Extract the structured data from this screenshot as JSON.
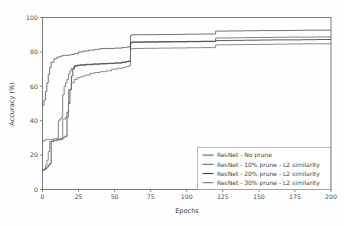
{
  "chart_data": {
    "type": "line",
    "title": "",
    "xlabel": "Epochs",
    "ylabel": "Accuracy (%)",
    "xlim": [
      0,
      200
    ],
    "ylim": [
      0,
      100
    ],
    "xticks": [
      0,
      25,
      50,
      75,
      100,
      125,
      150,
      175,
      200
    ],
    "yticks": [
      0,
      20,
      40,
      60,
      80,
      100
    ],
    "xtick_labels": [
      "0",
      "25",
      "50",
      "75",
      "100",
      "125",
      "150",
      "175",
      "200"
    ],
    "ytick_labels": [
      "0",
      "20",
      "40",
      "60",
      "80",
      "100"
    ],
    "grid": false,
    "legend_position": "lower right",
    "series": [
      {
        "name": "ResNet - No prune",
        "color": "#5a5a5a",
        "x": [
          0,
          1,
          2,
          3,
          4,
          5,
          6,
          8,
          10,
          12,
          14,
          16,
          18,
          20,
          22,
          25,
          28,
          32,
          36,
          40,
          45,
          50,
          55,
          58,
          60,
          61,
          62,
          70,
          80,
          90,
          100,
          110,
          119,
          120,
          121,
          130,
          140,
          150,
          160,
          170,
          180,
          190,
          200
        ],
        "y": [
          49.0,
          52.0,
          57.0,
          62.0,
          67.0,
          71.0,
          74.0,
          76.0,
          77.0,
          77.5,
          78.0,
          78.0,
          78.2,
          78.5,
          79.0,
          80.0,
          80.5,
          81.0,
          81.5,
          82.0,
          82.0,
          82.2,
          82.5,
          82.8,
          83.0,
          89.5,
          90.0,
          90.0,
          90.1,
          90.2,
          90.3,
          90.4,
          90.5,
          92.0,
          92.1,
          92.2,
          92.3,
          92.4,
          92.4,
          92.5,
          92.6,
          92.6,
          92.7
        ]
      },
      {
        "name": "ResNet - 10% prune - L2 similarity",
        "color": "#6a6a6a",
        "x": [
          0,
          1,
          2,
          3,
          5,
          8,
          10,
          11,
          12,
          13,
          14,
          15,
          16,
          17,
          18,
          19,
          20,
          22,
          24,
          26,
          30,
          35,
          40,
          45,
          50,
          55,
          58,
          60,
          61,
          62,
          70,
          80,
          90,
          100,
          110,
          119,
          120,
          121,
          130,
          140,
          150,
          160,
          170,
          180,
          190,
          200
        ],
        "y": [
          28.0,
          28.5,
          29.0,
          29.0,
          29.2,
          29.5,
          29.8,
          40.0,
          41.0,
          42.0,
          55.0,
          60.0,
          62.0,
          64.0,
          67.0,
          69.0,
          70.5,
          71.5,
          72.0,
          72.2,
          72.5,
          72.8,
          73.0,
          73.2,
          73.5,
          74.0,
          74.5,
          75.0,
          85.0,
          85.5,
          85.6,
          85.7,
          85.8,
          85.9,
          86.0,
          86.0,
          88.0,
          88.1,
          88.2,
          88.3,
          88.4,
          88.5,
          88.6,
          88.6,
          88.7,
          88.8
        ]
      },
      {
        "name": "ResNet - 20% prune - L2 similarity",
        "color": "#404040",
        "x": [
          0,
          1,
          2,
          3,
          4,
          5,
          6,
          8,
          10,
          12,
          14,
          15,
          16,
          17,
          18,
          19,
          20,
          21,
          22,
          24,
          26,
          30,
          35,
          40,
          45,
          50,
          55,
          58,
          60,
          61,
          62,
          70,
          80,
          90,
          100,
          110,
          119,
          120,
          121,
          130,
          140,
          150,
          160,
          170,
          180,
          190,
          200
        ],
        "y": [
          11.0,
          11.5,
          12.0,
          13.0,
          14.0,
          15.0,
          28.0,
          28.5,
          29.0,
          29.5,
          30.0,
          30.5,
          31.0,
          45.0,
          50.0,
          58.0,
          66.0,
          70.0,
          72.0,
          72.3,
          72.5,
          72.8,
          73.0,
          73.2,
          73.4,
          73.6,
          74.0,
          74.3,
          74.5,
          85.5,
          85.8,
          85.9,
          86.0,
          86.0,
          86.1,
          86.2,
          86.2,
          86.5,
          86.6,
          86.7,
          86.8,
          86.9,
          87.0,
          87.0,
          87.1,
          87.2,
          87.3
        ]
      },
      {
        "name": "ResNet - 30% prune - L2 similarity",
        "color": "#757575",
        "x": [
          0,
          1,
          2,
          3,
          4,
          5,
          6,
          8,
          10,
          12,
          14,
          16,
          18,
          20,
          22,
          24,
          26,
          28,
          30,
          33,
          36,
          40,
          44,
          48,
          52,
          56,
          58,
          60,
          61,
          62,
          70,
          80,
          90,
          100,
          110,
          119,
          120,
          121,
          130,
          140,
          150,
          160,
          170,
          180,
          190,
          200
        ],
        "y": [
          11.0,
          12.0,
          14.0,
          17.0,
          22.0,
          28.0,
          28.2,
          28.5,
          28.8,
          29.0,
          41.0,
          42.0,
          58.0,
          62.0,
          64.0,
          65.0,
          65.5,
          66.0,
          66.5,
          67.5,
          68.0,
          68.5,
          69.0,
          70.0,
          70.5,
          71.0,
          71.5,
          72.0,
          81.5,
          82.0,
          82.1,
          82.2,
          82.3,
          82.4,
          82.5,
          82.5,
          84.0,
          84.1,
          84.2,
          84.3,
          84.4,
          84.5,
          84.6,
          84.7,
          84.7,
          84.8
        ]
      }
    ]
  },
  "legend": {
    "entries": [
      {
        "label": "ResNet - No prune"
      },
      {
        "label": "ResNet - 10% prune - L2 similarity"
      },
      {
        "label": "ResNet - 20% prune - L2 similarity"
      },
      {
        "label": "ResNet - 30% prune - L2 similarity"
      }
    ]
  },
  "colors": {
    "axis": "#6f6f6f",
    "text": "#3d3d3d",
    "background": "#fefefe"
  }
}
